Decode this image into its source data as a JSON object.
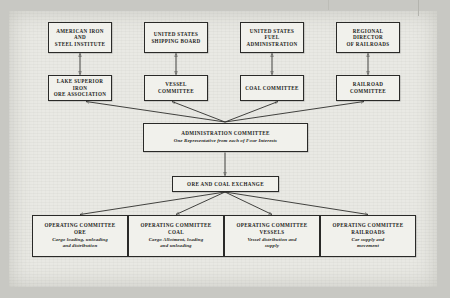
{
  "diagram": {
    "colors": {
      "ink": "#1d1d1b",
      "box_fill": "#f1f1ec",
      "paper": "#e9e9e4",
      "backdrop": "#c8c8c3"
    },
    "agencies": [
      {
        "id": "agency-american-iron-steel",
        "label": "AMERICAN IRON AND\nSTEEL INSTITUTE"
      },
      {
        "id": "agency-us-shipping-board",
        "label": "UNITED STATES\nSHIPPING BOARD"
      },
      {
        "id": "agency-us-fuel-administration",
        "label": "UNITED STATES FUEL\nADMINISTRATION"
      },
      {
        "id": "agency-regional-director-railroads",
        "label": "REGIONAL DIRECTOR\nOF RAILROADS"
      }
    ],
    "committees": [
      {
        "id": "committee-lake-superior-iron-ore",
        "label": "LAKE SUPERIOR IRON\nORE ASSOCIATION"
      },
      {
        "id": "committee-vessel",
        "label": "VESSEL COMMITTEE"
      },
      {
        "id": "committee-coal",
        "label": "COAL COMMITTEE"
      },
      {
        "id": "committee-railroad",
        "label": "RAILROAD\nCOMMITTEE"
      }
    ],
    "administration": {
      "id": "administration-committee",
      "title": "ADMINISTRATION COMMITTEE",
      "subtitle": "One Representative from each of Four Interests"
    },
    "exchange": {
      "id": "ore-and-coal-exchange",
      "title": "ORE AND COAL EXCHANGE"
    },
    "operating": [
      {
        "id": "operating-committee-ore",
        "title": "OPERATING COMMITTEE",
        "kind": "ORE",
        "duties": "Cargo loading, unloading\nand distribution"
      },
      {
        "id": "operating-committee-coal",
        "title": "OPERATING COMMITTEE",
        "kind": "COAL",
        "duties": "Cargo Allotment, loading\nand unloading"
      },
      {
        "id": "operating-committee-vessels",
        "title": "OPERATING COMMITTEE",
        "kind": "VESSELS",
        "duties": "Vessel distribution and\nsupply"
      },
      {
        "id": "operating-committee-railroads",
        "title": "OPERATING COMMITTEE",
        "kind": "RAILROADS",
        "duties": "Car supply and\nmovement"
      }
    ]
  }
}
